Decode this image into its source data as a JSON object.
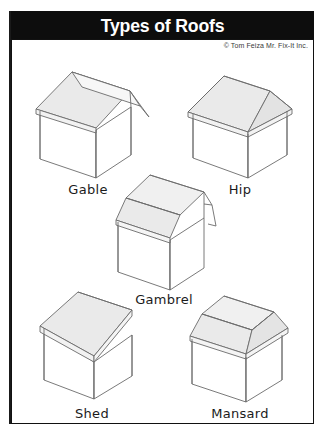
{
  "poster": {
    "title": "Types of Roofs",
    "credit": "© Tom Feiza Mr. Fix-It Inc.",
    "colors": {
      "title_bar_bg": "#0d0d0d",
      "title_text": "#ffffff",
      "frame_border": "#111111",
      "roof_fill": "#eaeaea",
      "roof_fill_light": "#f2f2f2",
      "wall_fill": "#ffffff",
      "line": "#6b6b6b",
      "label_text": "#1b1b1b",
      "background": "#ffffff"
    }
  },
  "figures": [
    {
      "id": "gable",
      "label": "Gable",
      "description": "Two sloping planes meeting at a central ridge with gable end walls"
    },
    {
      "id": "hip",
      "label": "Hip",
      "description": "Roof slopes down to the walls on all four sides"
    },
    {
      "id": "gambrel",
      "label": "Gambrel",
      "description": "Barn style roof with two different slopes on each side"
    },
    {
      "id": "shed",
      "label": "Shed",
      "description": "Single flat plane sloping in one direction"
    },
    {
      "id": "mansard",
      "label": "Mansard",
      "description": "Flat top with steep slopes on all four sides"
    }
  ]
}
